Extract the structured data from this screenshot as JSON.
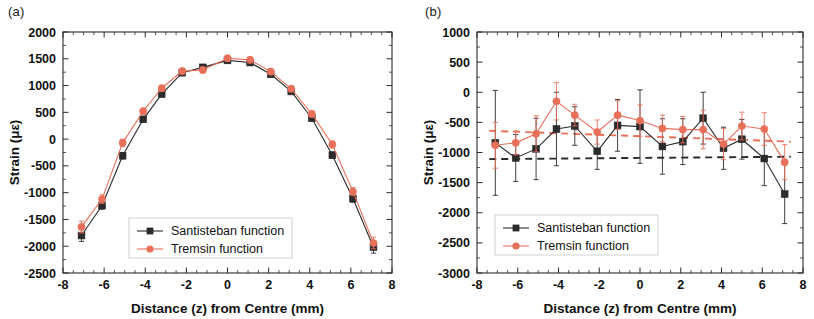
{
  "figure": {
    "width": 814,
    "height": 319,
    "background": "#ffffff"
  },
  "colors": {
    "santisteban": "#2b2b2b",
    "tremsin": "#e8705a",
    "axis": "#2b2b2b",
    "text": "#111111"
  },
  "panels": [
    {
      "id": "a",
      "label": "(a)",
      "xlabel": "Distance (z) from Centre (mm)",
      "ylabel": "Strain (με)",
      "xlim": [
        -8,
        8
      ],
      "ylim": [
        -2500,
        2000
      ],
      "xticks": [
        -8,
        -6,
        -4,
        -2,
        0,
        2,
        4,
        6,
        8
      ],
      "xticklabels": [
        "-8",
        "-6",
        "-4",
        "-2",
        "0",
        "2",
        "4",
        "6",
        "8"
      ],
      "yticks": [
        2000,
        1500,
        1000,
        500,
        0,
        -500,
        -1000,
        -1500,
        -2000,
        -2500
      ],
      "yticklabels": [
        "2000",
        "1500",
        "1000",
        "500",
        "0",
        "-500",
        "-1000",
        "-1500",
        "-2000",
        "-2500"
      ],
      "legend": [
        {
          "label": "Santisteban function",
          "color": "#2b2b2b",
          "marker": "square"
        },
        {
          "label": "Tremsin function",
          "color": "#e8705a",
          "marker": "circle"
        }
      ],
      "has_trendlines": false
    },
    {
      "id": "b",
      "label": "(b)",
      "xlabel": "Distance (z) from Centre (mm)",
      "ylabel": "Strain (με)",
      "xlim": [
        -8,
        8
      ],
      "ylim": [
        -3000,
        1000
      ],
      "xticks": [
        -8,
        -6,
        -4,
        -2,
        0,
        2,
        4,
        6,
        8
      ],
      "xticklabels": [
        "-8",
        "-6",
        "-4",
        "-2",
        "0",
        "2",
        "4",
        "6",
        "8"
      ],
      "yticks": [
        1000,
        500,
        0,
        -500,
        -1000,
        -1500,
        -2000,
        -2500,
        -3000
      ],
      "yticklabels": [
        "1000",
        "500",
        "0",
        "-500",
        "-1000",
        "-1500",
        "-2000",
        "-2500",
        "-3000"
      ],
      "legend": [
        {
          "label": "Santisteban function",
          "color": "#2b2b2b",
          "marker": "square"
        },
        {
          "label": "Tremsin function",
          "color": "#e8705a",
          "marker": "circle"
        }
      ],
      "has_trendlines": true
    }
  ],
  "chart_data": [
    {
      "type": "line",
      "panel": "a",
      "title": "(a)",
      "xlabel": "Distance (z) from Centre (mm)",
      "ylabel": "Strain (με)",
      "xlim": [
        -8,
        8
      ],
      "ylim": [
        -2500,
        2000
      ],
      "grid": false,
      "legend_position": "lower-center",
      "x": [
        -7.1,
        -6.1,
        -5.1,
        -4.1,
        -3.2,
        -2.2,
        -1.2,
        0.0,
        1.1,
        2.1,
        3.1,
        4.1,
        5.1,
        6.1,
        7.1
      ],
      "series": [
        {
          "name": "Santisteban function",
          "color": "#2b2b2b",
          "marker": "square",
          "values": [
            -1800,
            -1240,
            -310,
            370,
            840,
            1240,
            1340,
            1470,
            1430,
            1210,
            890,
            390,
            -300,
            -1110,
            -2020
          ],
          "errors": [
            110,
            70,
            60,
            50,
            50,
            50,
            50,
            50,
            50,
            50,
            50,
            50,
            60,
            70,
            110
          ]
        },
        {
          "name": "Tremsin function",
          "color": "#e8705a",
          "marker": "circle",
          "values": [
            -1640,
            -1120,
            -70,
            520,
            950,
            1270,
            1290,
            1510,
            1480,
            1260,
            940,
            470,
            -100,
            -980,
            -1940
          ],
          "errors": [
            110,
            80,
            70,
            60,
            55,
            55,
            55,
            55,
            55,
            55,
            55,
            55,
            65,
            75,
            110
          ]
        }
      ]
    },
    {
      "type": "line",
      "panel": "b",
      "title": "(b)",
      "xlabel": "Distance (z) from Centre (mm)",
      "ylabel": "Strain (με)",
      "xlim": [
        -8,
        8
      ],
      "ylim": [
        -3000,
        1000
      ],
      "grid": false,
      "legend_position": "lower-left",
      "x": [
        -7.1,
        -6.1,
        -5.1,
        -4.1,
        -3.2,
        -2.1,
        -1.1,
        0.0,
        1.1,
        2.1,
        3.1,
        4.1,
        5.0,
        6.1,
        7.1
      ],
      "series": [
        {
          "name": "Santisteban function",
          "color": "#2b2b2b",
          "marker": "square",
          "values": [
            -840,
            -1090,
            -940,
            -610,
            -560,
            -980,
            -550,
            -570,
            -900,
            -820,
            -430,
            -930,
            -780,
            -1100,
            -1690
          ],
          "errors": [
            870,
            390,
            510,
            610,
            320,
            300,
            430,
            610,
            460,
            380,
            430,
            350,
            330,
            450,
            490
          ]
        },
        {
          "name": "Tremsin function",
          "color": "#e8705a",
          "marker": "circle",
          "values": [
            -880,
            -840,
            -690,
            -150,
            -380,
            -660,
            -380,
            -470,
            -600,
            -620,
            -620,
            -860,
            -560,
            -610,
            -1160
          ],
          "errors": [
            380,
            200,
            300,
            310,
            180,
            200,
            240,
            260,
            220,
            220,
            320,
            260,
            230,
            270,
            290
          ]
        }
      ],
      "trendlines": [
        {
          "name": "Santisteban trend",
          "color": "#2b2b2b",
          "style": "dashed",
          "x": [
            -7.4,
            7.4
          ],
          "y": [
            -1110,
            -1070
          ]
        },
        {
          "name": "Tremsin trend",
          "color": "#e8705a",
          "style": "dashed",
          "x": [
            -7.4,
            7.4
          ],
          "y": [
            -640,
            -820
          ]
        }
      ]
    }
  ]
}
